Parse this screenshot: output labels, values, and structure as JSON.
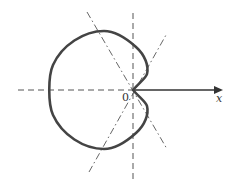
{
  "diagram": {
    "type": "polar-curve",
    "curve": "cardioid",
    "labels": {
      "origin": "0",
      "axis": "x"
    },
    "colors": {
      "curve": "#444444",
      "axis": "#333333",
      "dashed": "#555555"
    }
  }
}
